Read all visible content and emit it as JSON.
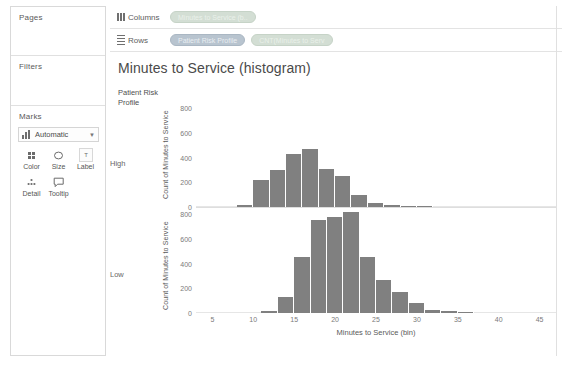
{
  "sidebar": {
    "sections": [
      {
        "title": "Pages",
        "name": "pages"
      },
      {
        "title": "Filters",
        "name": "filters"
      },
      {
        "title": "Marks",
        "name": "marks"
      }
    ],
    "marks": {
      "type_label": "Automatic",
      "type_icon": "bar-chart-icon",
      "caret_icon": "chevron-down-icon",
      "buttons": [
        {
          "label": "Color",
          "icon": "color-squares-icon"
        },
        {
          "label": "Size",
          "icon": "size-circle-icon"
        },
        {
          "label": "Label",
          "icon": "label-text-icon"
        },
        {
          "label": "Detail",
          "icon": "detail-dots-icon"
        },
        {
          "label": "Tooltip",
          "icon": "tooltip-bubble-icon"
        }
      ]
    }
  },
  "shelves": [
    {
      "name": "columns",
      "label": "Columns",
      "icon": "columns-grid-icon",
      "pills": [
        {
          "text": "Minutes to Service (b..",
          "kind": "green"
        }
      ]
    },
    {
      "name": "rows",
      "label": "Rows",
      "icon": "rows-lines-icon",
      "pills": [
        {
          "text": "Patient Risk Profile",
          "kind": "blue"
        },
        {
          "text": "CNT(Minutes to Serv",
          "kind": "green"
        }
      ]
    }
  ],
  "view": {
    "title": "Minutes to Service (histogram)",
    "row_field_header": "Patient Risk\nProfile",
    "row_headers": [
      "High",
      "Low"
    ]
  },
  "colors": {
    "bar": "#808080",
    "green_pill": "#d3ded4",
    "blue_pill": "#b8c4cf",
    "panel_border": "#d9d9d9",
    "axis_text": "#7a7a7a"
  },
  "chart_data": {
    "type": "bar",
    "title": "Minutes to Service (histogram)",
    "xlabel": "Minutes to Service (bin)",
    "ylabel": "Count of Minutes to Service",
    "xlim": [
      3,
      47
    ],
    "ylim": [
      0,
      850
    ],
    "yticks": [
      0,
      200,
      400,
      600,
      800
    ],
    "xticks": [
      5,
      10,
      15,
      20,
      25,
      30,
      35,
      40,
      45
    ],
    "grid": false,
    "legend": "none",
    "bin_width": 2,
    "panels": [
      {
        "name": "High",
        "x": [
          8,
          10,
          12,
          14,
          16,
          18,
          20,
          22,
          24,
          26,
          28,
          30
        ],
        "values": [
          15,
          220,
          300,
          430,
          470,
          305,
          250,
          100,
          30,
          20,
          12,
          5
        ]
      },
      {
        "name": "Low",
        "x": [
          11,
          13,
          15,
          17,
          19,
          21,
          23,
          25,
          27,
          29,
          31,
          33,
          35
        ],
        "values": [
          20,
          130,
          450,
          750,
          775,
          815,
          455,
          270,
          170,
          85,
          25,
          20,
          10
        ]
      }
    ]
  }
}
